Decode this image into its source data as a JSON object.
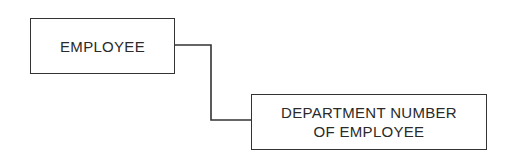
{
  "diagram": {
    "nodes": [
      {
        "id": "employee",
        "lines": [
          "EMPLOYEE"
        ]
      },
      {
        "id": "department",
        "lines": [
          "DEPARTMENT NUMBER",
          "OF EMPLOYEE"
        ]
      }
    ],
    "edges": [
      {
        "from": "employee",
        "to": "department",
        "style": "orthogonal"
      }
    ]
  }
}
